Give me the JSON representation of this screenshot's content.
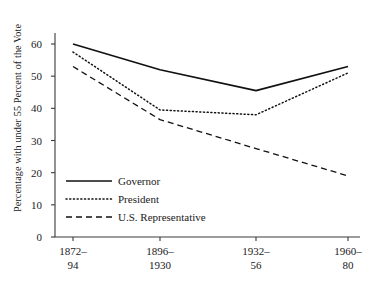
{
  "chart_data": {
    "type": "line",
    "title": "",
    "xlabel": "",
    "ylabel": "Percentage with under 55 Percent of the Vote",
    "categories": [
      "1872–94",
      "1896–1930",
      "1932–56",
      "1960–80"
    ],
    "category_lines": [
      [
        "1872–",
        "94"
      ],
      [
        "1896–",
        "1930"
      ],
      [
        "1932–",
        "56"
      ],
      [
        "1960–",
        "80"
      ]
    ],
    "ylim": [
      0,
      60
    ],
    "yticks": [
      0,
      10,
      20,
      30,
      40,
      50,
      60
    ],
    "ytick_labels": [
      "0",
      "10",
      "20",
      "30",
      "40",
      "50",
      "60"
    ],
    "grid": false,
    "legend_position": "lower-left-inside",
    "series": [
      {
        "name": "Governor",
        "style": "solid",
        "color": "#111111",
        "values": [
          60,
          52,
          45.5,
          53
        ]
      },
      {
        "name": "President",
        "style": "dotted",
        "color": "#111111",
        "values": [
          57.5,
          39.5,
          38,
          51
        ]
      },
      {
        "name": "U.S. Representative",
        "style": "dashed",
        "color": "#111111",
        "values": [
          53,
          36.5,
          27.5,
          19
        ]
      }
    ]
  },
  "axis": {
    "line_color": "#3a3a3a"
  }
}
